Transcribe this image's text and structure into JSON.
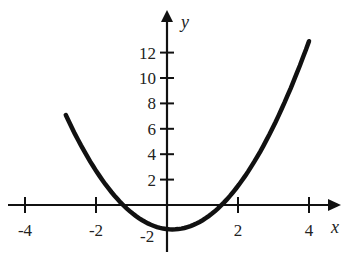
{
  "chart_data": {
    "type": "line",
    "title": "",
    "xlabel": "x",
    "ylabel": "y",
    "xlim": [
      -4.5,
      4.7
    ],
    "ylim": [
      -3,
      14.5
    ],
    "grid": false,
    "legend": null,
    "x_ticks": [
      -4,
      -2,
      2,
      4
    ],
    "x_tick_labels": [
      "-4",
      "-2",
      "2",
      "4"
    ],
    "y_ticks": [
      2,
      4,
      6,
      8,
      10,
      12
    ],
    "y_tick_labels": [
      "2",
      "4",
      "6",
      "8",
      "10",
      "12"
    ],
    "origin_label": "-2",
    "series": [
      {
        "name": "parabola",
        "approx_equation": "y = x^2 - 0.3x - 1.9",
        "x": [
          -2.85,
          -2.5,
          -2.0,
          -1.5,
          -1.27,
          -1.0,
          -0.5,
          0.0,
          0.15,
          0.5,
          1.0,
          1.5,
          1.55,
          2.0,
          2.5,
          3.0,
          3.5,
          4.0
        ],
        "y": [
          7.0,
          5.1,
          2.7,
          0.8,
          0.0,
          -0.6,
          -1.5,
          -1.9,
          -1.92,
          -1.8,
          -1.2,
          -0.1,
          0.0,
          1.5,
          3.6,
          6.2,
          9.3,
          12.9
        ]
      }
    ]
  }
}
